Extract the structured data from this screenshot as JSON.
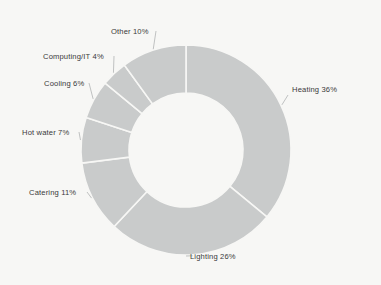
{
  "chart_data": {
    "type": "pie",
    "variant": "donut",
    "title": "",
    "subtitle": "",
    "xlabel": "",
    "ylabel": "",
    "units": "percent",
    "total": 100,
    "grid": false,
    "legend": "none",
    "label_format": "{name} {value}%",
    "start_angle_deg": 0,
    "direction": "clockwise",
    "hole_ratio": 0.54,
    "categories": [
      "Heating",
      "Lighting",
      "Catering",
      "Hot water",
      "Cooling",
      "Computing/IT",
      "Other"
    ],
    "values": [
      36,
      26,
      11,
      7,
      6,
      4,
      10
    ],
    "slices": [
      {
        "name": "Heating",
        "value": 36,
        "label": "Heating 36%",
        "color": "#c9cbcb"
      },
      {
        "name": "Lighting",
        "value": 26,
        "label": "Lighting 26%",
        "color": "#c9cbcb"
      },
      {
        "name": "Catering",
        "value": 11,
        "label": "Catering 11%",
        "color": "#c9cbcb"
      },
      {
        "name": "Hot water",
        "value": 7,
        "label": "Hot water 7%",
        "color": "#c9cbcb"
      },
      {
        "name": "Cooling",
        "value": 6,
        "label": "Cooling 6%",
        "color": "#c9cbcb"
      },
      {
        "name": "Computing/IT",
        "value": 4,
        "label": "Computing/IT 4%",
        "color": "#c9cbcb"
      },
      {
        "name": "Other",
        "value": 10,
        "label": "Other 10%",
        "color": "#c9cbcb"
      }
    ]
  },
  "style": {
    "background_color": "#f7f7f5",
    "slice_color": "#c9cbcb",
    "slice_border_color": "#f7f7f5",
    "label_color": "#3a3a3a",
    "leader_line_color": "#b9bbbb"
  },
  "geometry": {
    "center_x": 186,
    "center_y": 150,
    "outer_radius": 105,
    "inner_radius": 57
  }
}
